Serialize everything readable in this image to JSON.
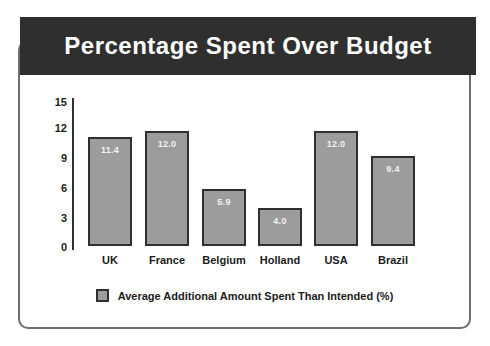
{
  "window": {
    "title": "Percentage Spent Over Budget"
  },
  "chart_data": {
    "type": "bar",
    "title": "Percentage Spent Over Budget",
    "categories": [
      "UK",
      "France",
      "Belgium",
      "Holland",
      "USA",
      "Brazil"
    ],
    "values": [
      11.4,
      12.0,
      5.9,
      4.0,
      12.0,
      9.4
    ],
    "value_labels": [
      "11.4",
      "12.0",
      "5.9",
      "4.0",
      "12.0",
      "9.4"
    ],
    "series": [
      {
        "name": "Average Additional Amount Spent Than Intended (%)",
        "values": [
          11.4,
          12.0,
          5.9,
          4.0,
          12.0,
          9.4
        ]
      }
    ],
    "legend": "Average Additional Amount Spent Than Intended (%)",
    "legend_position": "bottom",
    "xlabel": "",
    "ylabel": "",
    "ylim": [
      0,
      15
    ],
    "ytick_step": 3,
    "yticks": [
      "15",
      "12",
      "9",
      "6",
      "3",
      "0"
    ],
    "grid": false,
    "colors": {
      "title_bg": "#2f2f2f",
      "title_text": "#ffffff",
      "bar_fill": "#9c9c9c",
      "bar_border": "#2f2f2f",
      "value_label_text": "#f2f2f2",
      "axis_text": "#1c1c1c",
      "panel_border": "#6f6f6f",
      "background": "#ffffff"
    }
  }
}
